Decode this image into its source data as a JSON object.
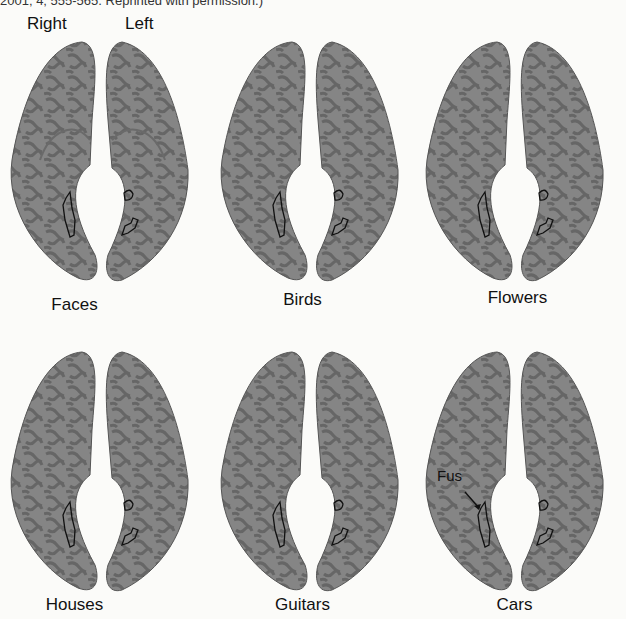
{
  "header": {
    "citation_fragment": "2001; 4; 555-565. Reprinted with permission.)"
  },
  "hemisphere_labels": {
    "right": "Right",
    "left": "Left"
  },
  "panels": [
    {
      "label": "Faces"
    },
    {
      "label": "Birds"
    },
    {
      "label": "Flowers"
    },
    {
      "label": "Houses"
    },
    {
      "label": "Guitars"
    },
    {
      "label": "Cars"
    }
  ],
  "annotation": {
    "fus": "Fus"
  },
  "colors": {
    "cortex": "#7d7d7d",
    "sulci": "#606060",
    "roi_outline": "#111111",
    "background": "#fbfbf9"
  }
}
